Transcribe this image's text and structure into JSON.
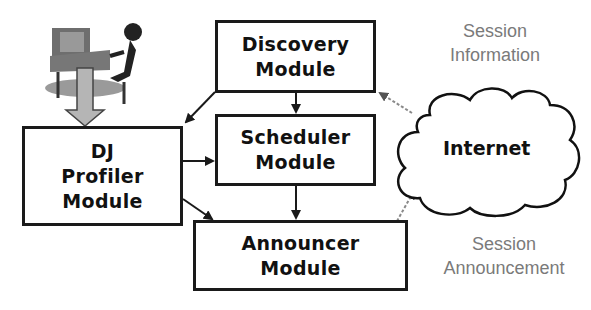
{
  "diagram": {
    "modules": {
      "dj_profiler": [
        "DJ",
        "Profiler",
        "Module"
      ],
      "discovery": [
        "Discovery",
        "Module"
      ],
      "scheduler": [
        "Scheduler",
        "Module"
      ],
      "announcer": [
        "Announcer",
        "Module"
      ]
    },
    "cloud_label": "Internet",
    "notes": {
      "session_information": [
        "Session",
        "Information"
      ],
      "session_announcement": [
        "Session",
        "Announcement"
      ]
    },
    "icons": {
      "user": "person-at-computer-icon"
    },
    "colors": {
      "ink": "#1a1a1a",
      "note_text": "#7a7a7a",
      "dashed_arrow": "#8a8a8a",
      "user_arrow_fill": "#b5b5b5"
    }
  }
}
